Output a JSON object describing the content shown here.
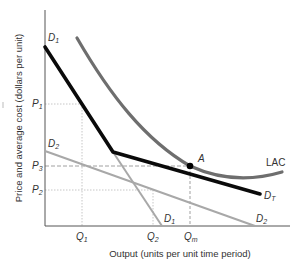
{
  "figure": {
    "y_axis_title": "Price and average cost (dollars per unit)",
    "x_axis_title": "Output (units per unit time period)",
    "y_ticks": [
      {
        "label": "P",
        "sub": "1"
      },
      {
        "label": "P",
        "sub": "3"
      },
      {
        "label": "P",
        "sub": "2"
      }
    ],
    "x_ticks": [
      {
        "label": "Q",
        "sub": "1"
      },
      {
        "label": "Q",
        "sub": "2"
      },
      {
        "label": "Q",
        "sub": "m"
      }
    ],
    "curves": {
      "d1_top": {
        "label": "D",
        "sub": "1"
      },
      "d1_bottom": {
        "label": "D",
        "sub": "1"
      },
      "d2_left": {
        "label": "D",
        "sub": "2"
      },
      "d2_right": {
        "label": "D",
        "sub": "2"
      },
      "dt": {
        "label": "D",
        "sub": "T"
      },
      "lac": {
        "label": "LAC"
      }
    },
    "point": {
      "label": "A"
    },
    "colors": {
      "axis": "#555555",
      "dt": "#0a0a0a",
      "lac": "#6e6e6e",
      "demand_gray": "#a8a8a8",
      "guides": "#b5b5b5"
    }
  }
}
